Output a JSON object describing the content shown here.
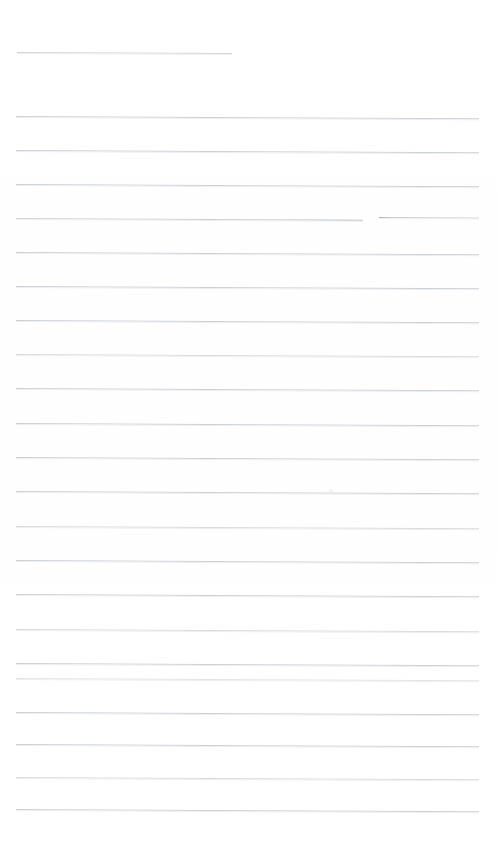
{
  "document": {
    "kind": "scanned-ruled-page",
    "title": "",
    "body_text": "",
    "page_width": 498,
    "page_height": 843,
    "background_color": "#ffffff",
    "rule_color": "#c9ced3",
    "rule_color_faint": "#d6dadd",
    "rule_thickness_px": 1,
    "rule_spacing_px": 34.6,
    "rule_tilt_deg": 0.28,
    "rule_count": 22,
    "margin_left_px": 16,
    "margin_right_px": 479,
    "notes": "No handwriting or printed text is visible; page is blank ruled paper."
  },
  "rules": [
    {
      "id": "rule-1",
      "y": 52,
      "x": 17,
      "width": 215,
      "variant": "short",
      "label": "partial-top-rule"
    },
    {
      "id": "rule-2",
      "y": 116,
      "x": 16,
      "width": 463,
      "variant": "normal",
      "label": "rule"
    },
    {
      "id": "rule-3",
      "y": 150,
      "x": 16,
      "width": 463,
      "variant": "normal",
      "label": "rule"
    },
    {
      "id": "rule-4",
      "y": 184,
      "x": 16,
      "width": 463,
      "variant": "normal",
      "label": "rule"
    },
    {
      "id": "rule-5a",
      "y": 218,
      "x": 16,
      "width": 347,
      "variant": "seg-a",
      "label": "broken-rule-left-segment"
    },
    {
      "id": "rule-5b",
      "y": 217,
      "x": 379,
      "width": 100,
      "variant": "seg-b",
      "label": "broken-rule-right-segment"
    },
    {
      "id": "rule-6",
      "y": 252,
      "x": 16,
      "width": 463,
      "variant": "normal",
      "label": "rule"
    },
    {
      "id": "rule-7",
      "y": 286,
      "x": 16,
      "width": 463,
      "variant": "normal",
      "label": "rule"
    },
    {
      "id": "rule-8",
      "y": 320,
      "x": 16,
      "width": 463,
      "variant": "normal",
      "label": "rule"
    },
    {
      "id": "rule-9",
      "y": 354,
      "x": 16,
      "width": 463,
      "variant": "faint",
      "label": "rule"
    },
    {
      "id": "rule-10",
      "y": 388,
      "x": 16,
      "width": 463,
      "variant": "normal",
      "label": "rule"
    },
    {
      "id": "rule-11",
      "y": 423,
      "x": 16,
      "width": 463,
      "variant": "normal",
      "label": "rule"
    },
    {
      "id": "rule-12",
      "y": 457,
      "x": 16,
      "width": 463,
      "variant": "normal",
      "label": "rule"
    },
    {
      "id": "rule-13",
      "y": 491,
      "x": 16,
      "width": 463,
      "variant": "normal",
      "label": "rule"
    },
    {
      "id": "rule-14",
      "y": 526,
      "x": 16,
      "width": 463,
      "variant": "faint",
      "label": "rule"
    },
    {
      "id": "rule-15",
      "y": 560,
      "x": 16,
      "width": 463,
      "variant": "normal",
      "label": "rule"
    },
    {
      "id": "rule-16",
      "y": 594,
      "x": 16,
      "width": 463,
      "variant": "normal",
      "label": "rule"
    },
    {
      "id": "rule-17",
      "y": 629,
      "x": 16,
      "width": 463,
      "variant": "faint",
      "label": "rule"
    },
    {
      "id": "rule-18",
      "y": 663,
      "x": 16,
      "width": 463,
      "variant": "normal",
      "label": "rule"
    },
    {
      "id": "rule-19",
      "y": 678,
      "x": 16,
      "width": 463,
      "variant": "faintest",
      "label": "rule"
    },
    {
      "id": "rule-20",
      "y": 712,
      "x": 16,
      "width": 463,
      "variant": "normal",
      "label": "rule"
    },
    {
      "id": "rule-21",
      "y": 744,
      "x": 16,
      "width": 463,
      "variant": "normal",
      "label": "rule"
    },
    {
      "id": "rule-22",
      "y": 777,
      "x": 16,
      "width": 463,
      "variant": "faint",
      "label": "rule"
    },
    {
      "id": "rule-23",
      "y": 809,
      "x": 16,
      "width": 463,
      "variant": "normal",
      "label": "rule"
    }
  ],
  "specks": [
    {
      "id": "speck-1",
      "x": 329,
      "y": 489,
      "label": "scan-speck"
    }
  ]
}
